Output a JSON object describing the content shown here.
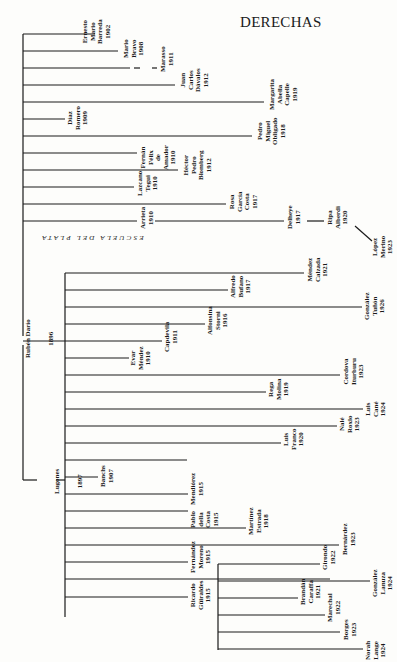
{
  "title": "DERECHAS",
  "school_label": "ESCUELA DEL PLATA",
  "root": {
    "name": "Rubén Darío",
    "year": "1896"
  },
  "lugones": {
    "name": "Lugones",
    "year": "1897"
  },
  "nodes": {
    "barreda": {
      "lines": [
        "Ernesto",
        "Mario",
        "Barreda",
        "1902"
      ]
    },
    "bravo": {
      "lines": [
        "Mario",
        "Bravo",
        "1908"
      ]
    },
    "marasso": {
      "lines": [
        "Marasso",
        "1911"
      ]
    },
    "davalos": {
      "lines": [
        "Juan",
        "Carlos",
        "Dávalos",
        "1912"
      ]
    },
    "capelle": {
      "lines": [
        "Margarita",
        "Abella",
        "Capelle",
        "1919"
      ]
    },
    "romero": {
      "lines": [
        "Díaz",
        "Romero",
        "1909"
      ]
    },
    "obligado": {
      "lines": [
        "Pedro",
        "Miguel",
        "Obligado",
        "1918"
      ]
    },
    "amador": {
      "lines": [
        "Fernán",
        "Félix",
        "de",
        "Amador",
        "1910"
      ]
    },
    "blomberg": {
      "lines": [
        "Héctor",
        "Pedro",
        "Blomberg",
        "1912"
      ]
    },
    "tegui": {
      "lines": [
        "Lazcano",
        "Tegui",
        "1910"
      ]
    },
    "costa": {
      "lines": [
        "Rosa",
        "García",
        "Costa",
        "1917"
      ]
    },
    "arrieta": {
      "lines": [
        "Arrieta",
        "1910"
      ]
    },
    "delfino": {
      "lines": [
        "Delheye",
        "1917"
      ]
    },
    "alberdi": {
      "lines": [
        "Ripa",
        "Alberdi",
        "1920"
      ]
    },
    "merino": {
      "lines": [
        "López",
        "Merino",
        "1923"
      ]
    },
    "calzada": {
      "lines": [
        "Méndez",
        "Calzada",
        "1921"
      ]
    },
    "bufano": {
      "lines": [
        "Alfredo",
        "Bufano",
        "1917"
      ]
    },
    "tunon": {
      "lines": [
        "González",
        "Tuñón",
        "1926"
      ]
    },
    "storni": {
      "lines": [
        "Alfonsina",
        "Storni",
        "1916"
      ]
    },
    "capdevila": {
      "lines": [
        "Capdevila",
        "1911"
      ]
    },
    "mendez": {
      "lines": [
        "Evar",
        "Méndez",
        "1910"
      ]
    },
    "ibarbourou": {
      "lines": [
        "Cordova",
        "Iturburu",
        "1923"
      ]
    },
    "molina": {
      "lines": [
        "Rega",
        "Molina",
        "1919"
      ]
    },
    "cane": {
      "lines": [
        "Luis",
        "Cané",
        "1924"
      ]
    },
    "rosso": {
      "lines": [
        "Nalé",
        "Roxlo",
        "1923"
      ]
    },
    "franco": {
      "lines": [
        "Luis",
        "Franco",
        "1920"
      ]
    },
    "banchs": {
      "lines": [
        "Banchs",
        "1907"
      ]
    },
    "mendiorez": {
      "lines": [
        "Mendiórez",
        "1915"
      ]
    },
    "dellacosta": {
      "lines": [
        "Pablo",
        "della",
        "Costa",
        "1915"
      ]
    },
    "estrada": {
      "lines": [
        "Martínez",
        "Estrada",
        "1918"
      ]
    },
    "bernardez": {
      "lines": [
        "Bernárdez",
        "1923"
      ]
    },
    "moreno": {
      "lines": [
        "Fernández",
        "Moreno",
        "1915"
      ]
    },
    "giraldes": {
      "lines": [
        "Ricardo",
        "Güiraldes",
        "1915"
      ]
    },
    "girondo": {
      "lines": [
        "Girondo",
        "1922"
      ]
    },
    "lanuza": {
      "lines": [
        "González",
        "Lanuza",
        "1924"
      ]
    },
    "carafia": {
      "lines": [
        "Brandán",
        "Caraffa",
        "1921"
      ]
    },
    "marechal": {
      "lines": [
        "Marechal",
        "1922"
      ]
    },
    "borges": {
      "lines": [
        "Borges",
        "1923"
      ]
    },
    "lange": {
      "lines": [
        "Norah",
        "Lange",
        "1924"
      ]
    }
  }
}
